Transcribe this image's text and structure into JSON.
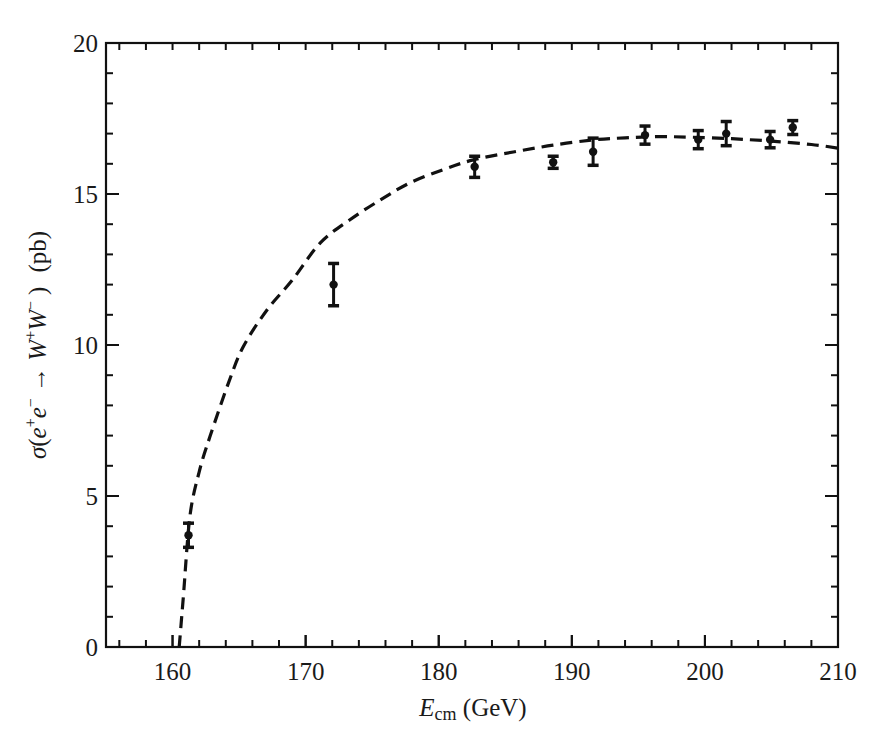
{
  "chart_data": {
    "type": "scatter",
    "title": "",
    "xlabel": "E_cm (GeV)",
    "xlabel_main": "E",
    "xlabel_sub": "cm",
    "xlabel_unit": "(GeV)",
    "ylabel": "σ(e⁺e⁻ → W⁺W⁻)  (pb)",
    "xlim": [
      155,
      210
    ],
    "ylim": [
      0,
      20
    ],
    "x_ticks": [
      160,
      170,
      180,
      190,
      200,
      210
    ],
    "x_tick_labels": [
      "160",
      "170",
      "180",
      "190",
      "200",
      "210"
    ],
    "x_minor_step": 2,
    "y_ticks": [
      0,
      5,
      10,
      15,
      20
    ],
    "y_tick_labels": [
      "0",
      "5",
      "10",
      "15",
      "20"
    ],
    "y_minor_step": 1,
    "grid": false,
    "legend": null,
    "series": [
      {
        "name": "Measured cross section",
        "style": "points-with-error-bars",
        "x": [
          161.2,
          172.1,
          182.7,
          188.6,
          191.6,
          195.5,
          199.5,
          201.6,
          204.9,
          206.6
        ],
        "y": [
          3.7,
          12.0,
          15.9,
          16.05,
          16.4,
          16.95,
          16.8,
          17.0,
          16.8,
          17.2
        ],
        "yerr": [
          0.4,
          0.7,
          0.35,
          0.2,
          0.45,
          0.3,
          0.3,
          0.4,
          0.27,
          0.23
        ]
      },
      {
        "name": "Theory prediction",
        "style": "dashed-line",
        "x": [
          160.5,
          160.8,
          161.3,
          162.0,
          162.8,
          164.2,
          165.3,
          167.1,
          169.0,
          171.1,
          173.3,
          175.6,
          177.8,
          180.3,
          182.6,
          185.6,
          188.6,
          191.6,
          194.0,
          196.5,
          199.0,
          202.0,
          205.0,
          208.0,
          210.0
        ],
        "y": [
          0.0,
          1.6,
          4.3,
          5.8,
          6.95,
          8.74,
          9.93,
          11.16,
          12.15,
          13.38,
          14.14,
          14.8,
          15.36,
          15.8,
          16.13,
          16.39,
          16.62,
          16.79,
          16.86,
          16.9,
          16.88,
          16.83,
          16.75,
          16.64,
          16.52
        ]
      }
    ]
  },
  "labels": {
    "x_axis_main": "E",
    "x_axis_sub": "cm",
    "x_axis_unit": " (GeV)",
    "y_axis_sigma": "σ",
    "y_axis_open": "(",
    "y_axis_e": "e",
    "y_axis_plus": "+",
    "y_axis_minus": "−",
    "y_axis_arrow": " → ",
    "y_axis_W": "W",
    "y_axis_close": ")",
    "y_axis_unit": "(pb)"
  }
}
